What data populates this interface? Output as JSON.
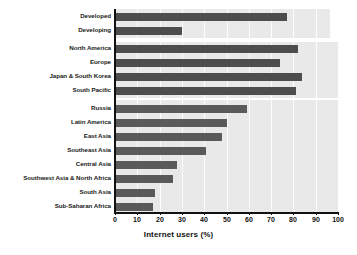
{
  "chart_data": {
    "type": "bar",
    "orientation": "horizontal",
    "title": "",
    "xlabel": "Internet users (%)",
    "ylabel": "",
    "xlim": [
      0,
      100
    ],
    "xticks": [
      0,
      10,
      20,
      30,
      40,
      50,
      60,
      70,
      80,
      90,
      100
    ],
    "grid": "vertical",
    "legend": "none",
    "categories": [
      "Developed",
      "Developing",
      "North America",
      "Europe",
      "Japan & South Korea",
      "South Pacific",
      "Russia",
      "Latin America",
      "East Asia",
      "Southeast Asia",
      "Central Asia",
      "Southwest Asia & North Africa",
      "South Asia",
      "Sub-Saharan Africa"
    ],
    "values": [
      77,
      30,
      82,
      74,
      84,
      81,
      59,
      50,
      48,
      41,
      28,
      26,
      18,
      17
    ],
    "groups": [
      {
        "name": "development-status",
        "categories": [
          "Developed",
          "Developing"
        ]
      },
      {
        "name": "high-income-regions",
        "categories": [
          "North America",
          "Europe",
          "Japan & South Korea",
          "South Pacific"
        ]
      },
      {
        "name": "other-regions",
        "categories": [
          "Russia",
          "Latin America",
          "East Asia",
          "Southeast Asia",
          "Central Asia",
          "Southwest Asia & North Africa",
          "South Asia",
          "Sub-Saharan Africa"
        ]
      }
    ]
  },
  "colors": {
    "bar": "#4d4d4d",
    "plot_background": "#e9e9e9",
    "gridline": "#ffffff",
    "axis": "#111111",
    "page_background": "#ffffff",
    "label_text": "#1a1a1a"
  },
  "labels": {
    "c0": "Developed",
    "c1": "Developing",
    "c2": "North America",
    "c3": "Europe",
    "c4": "Japan & South Korea",
    "c5": "South Pacific",
    "c6": "Russia",
    "c7": "Latin America",
    "c8": "East Asia",
    "c9": "Southeast Asia",
    "c10": "Central Asia",
    "c11": "Southwest Asia & North Africa",
    "c12": "South Asia",
    "c13": "Sub-Saharan Africa"
  },
  "ticks": {
    "t0": "0",
    "t1": "10",
    "t2": "20",
    "t3": "30",
    "t4": "40",
    "t5": "50",
    "t6": "60",
    "t7": "70",
    "t8": "80",
    "t9": "90",
    "t10": "100"
  },
  "axis_title": "Internet users (%)"
}
